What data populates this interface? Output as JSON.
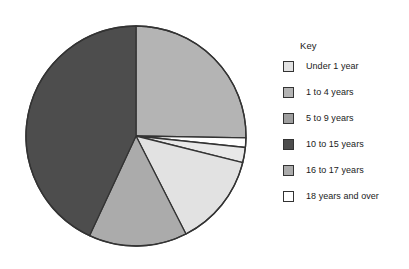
{
  "legend": {
    "title": "Key",
    "position": "right"
  },
  "chart_data": {
    "type": "pie",
    "title": "",
    "center": [
      133,
      137
    ],
    "radius": 110,
    "start_angle_deg": 0,
    "direction": "clockwise",
    "stroke": "#333333",
    "categories": [
      "Under 1 year",
      "1 to 4 years",
      "5 to 9 years",
      "10 to 15 years",
      "16 to 17 years",
      "18 years and over"
    ],
    "colors": [
      "#e2e2e2",
      "#b4b4b4",
      "#9e9e9e",
      "#4d4d4d",
      "#ababab",
      "#ffffff"
    ],
    "slices": [
      {
        "label": "1 to 4 years",
        "color": "#b4b4b4",
        "start_deg": 0,
        "end_deg": 91,
        "value": 25.3
      },
      {
        "label": "18 years and over",
        "color": "#ffffff",
        "start_deg": 91,
        "end_deg": 96,
        "value": 1.4
      },
      {
        "label": "5 to 9 years",
        "color": "#e8e8e8",
        "start_deg": 96,
        "end_deg": 104,
        "value": 2.2
      },
      {
        "label": "Under 1 year",
        "color": "#e2e2e2",
        "start_deg": 104,
        "end_deg": 153,
        "value": 13.6
      },
      {
        "label": "16 to 17 years",
        "color": "#ababab",
        "start_deg": 153,
        "end_deg": 205,
        "value": 14.4
      },
      {
        "label": "10 to 15 years",
        "color": "#4d4d4d",
        "start_deg": 205,
        "end_deg": 360,
        "value": 43.1
      }
    ],
    "values": [
      13.6,
      25.3,
      2.2,
      43.1,
      14.4,
      1.4
    ],
    "legend_position": "right"
  }
}
